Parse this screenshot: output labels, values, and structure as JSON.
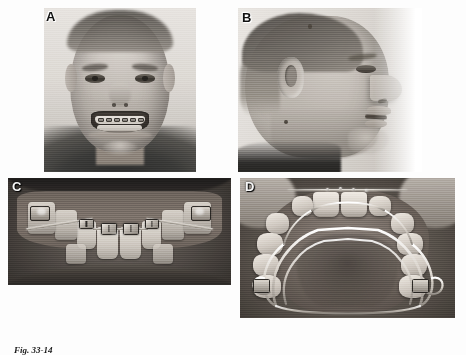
{
  "figure": {
    "caption_number": "Fig. 33-14",
    "caption_text": "",
    "panel_count": 4,
    "color_mode": "grayscale",
    "background_color": "#ffffff"
  },
  "panels": [
    {
      "id": "A",
      "label": "A",
      "name": "frontal-smiling-photograph",
      "description": "Frontal extraoral photograph of a smiling adolescent patient with fixed orthodontic appliances visible on the anterior teeth.",
      "label_position": "top-left"
    },
    {
      "id": "B",
      "label": "B",
      "name": "lateral-profile-photograph",
      "description": "Right lateral profile extraoral photograph of the same patient showing facial convexity and lip posture.",
      "label_position": "top-left"
    },
    {
      "id": "C",
      "label": "C",
      "name": "intraoral-frontal-photograph",
      "description": "Intraoral frontal view showing maxillary brackets, archwire and anterior open relationship.",
      "label_position": "top-left"
    },
    {
      "id": "D",
      "label": "D",
      "name": "maxillary-occlusal-photograph",
      "description": "Maxillary occlusal view showing a removable palatal appliance with labial wire and banded molars.",
      "label_position": "top-left"
    }
  ],
  "colors": {
    "page_background": "#ffffff",
    "label_text": "#111111",
    "caption_text": "#1b1b1b"
  }
}
